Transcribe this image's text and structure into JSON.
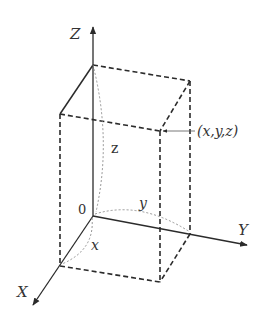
{
  "diagram": {
    "type": "3d-coordinate-box",
    "axes": {
      "x_label": "X",
      "y_label": "Y",
      "z_label": "Z"
    },
    "origin_label": "0",
    "point_label": "(x,y,z)",
    "dimension_labels": {
      "x": "x",
      "y": "y",
      "z": "z"
    },
    "colors": {
      "line": "#2b2b2b",
      "dotted": "#888888",
      "background": "#ffffff"
    }
  }
}
